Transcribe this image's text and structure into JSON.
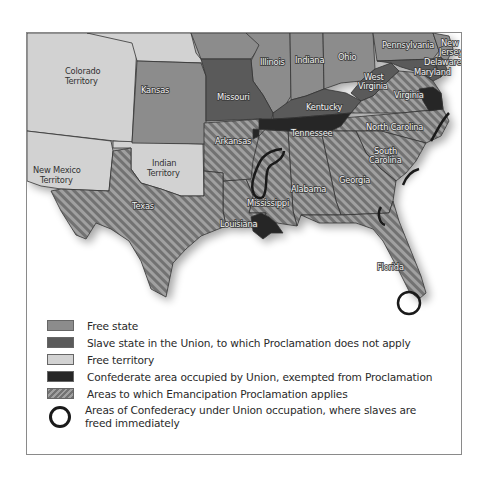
{
  "map": {
    "title": "Emancipation Proclamation map",
    "colors": {
      "free_state": "#8c8c8c",
      "slave_state_union": "#5a5a5a",
      "free_territory": "#d2d2d2",
      "confederate_occupied_exempt": "#262626",
      "proclamation_applies_a": "#7a7a7a",
      "proclamation_applies_b": "#a0a0a0",
      "circle": "#1a1a1a"
    },
    "labels": {
      "colorado_1": "Colorado",
      "colorado_2": "Territory",
      "kansas": "Kansas",
      "missouri": "Missouri",
      "illinois": "Illinois",
      "indiana": "Indiana",
      "ohio": "Ohio",
      "pennsylvania": "Pennsylvania",
      "new_jersey_1": "New",
      "new_jersey_2": "Jersey",
      "delaware": "Delaware",
      "maryland": "Maryland",
      "west_virginia_1": "West",
      "west_virginia_2": "Virginia",
      "virginia": "Virginia",
      "kentucky": "Kentucky",
      "tennessee": "Tennessee",
      "north_carolina": "North Carolina",
      "south_carolina_1": "South",
      "south_carolina_2": "Carolina",
      "georgia": "Georgia",
      "alabama": "Alabama",
      "mississippi": "Mississippi",
      "louisiana": "Louisiana",
      "arkansas": "Arkansas",
      "texas": "Texas",
      "florida": "Florida",
      "indian_territory_1": "Indian",
      "indian_territory_2": "Territory",
      "new_mexico_1": "New Mexico",
      "new_mexico_2": "Territory"
    }
  },
  "legend": {
    "items": [
      {
        "label": "Free state",
        "type": "free_state"
      },
      {
        "label": "Slave state in the Union, to which Proclamation does not apply",
        "type": "slave_state_union"
      },
      {
        "label": "Free territory",
        "type": "free_territory"
      },
      {
        "label": "Confederate area occupied by Union, exempted from Proclamation",
        "type": "confederate_occupied_exempt"
      },
      {
        "label": "Areas to which Emancipation Proclamation applies",
        "type": "proclamation_applies"
      },
      {
        "label": "Areas of Confederacy under Union occupation, where slaves are freed immediately",
        "type": "union_occupation_circle"
      }
    ]
  }
}
